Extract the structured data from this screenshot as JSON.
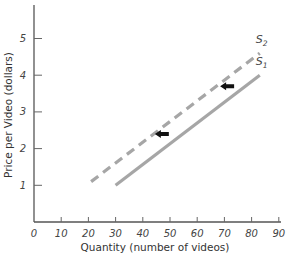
{
  "chart_data": {
    "type": "line",
    "title": "",
    "xlabel": "Quantity (number of videos)",
    "ylabel": "Price per Video (dollars)",
    "xlim": [
      0,
      90
    ],
    "ylim": [
      0,
      6
    ],
    "x_ticks": [
      "0",
      "10",
      "20",
      "30",
      "40",
      "50",
      "60",
      "70",
      "80",
      "90"
    ],
    "y_ticks": [
      "1",
      "2",
      "3",
      "4",
      "5"
    ],
    "grid": false,
    "series": [
      {
        "name": "S1",
        "label_main": "S",
        "label_sub": "1",
        "style": "solid",
        "color": "#a6a6a6",
        "points": [
          [
            30,
            1
          ],
          [
            83,
            4
          ]
        ]
      },
      {
        "name": "S2",
        "label_main": "S",
        "label_sub": "2",
        "style": "dashed",
        "color": "#a6a6a6",
        "points": [
          [
            21,
            1.1
          ],
          [
            83,
            4.6
          ]
        ]
      }
    ],
    "annotations": [
      {
        "type": "arrow-left",
        "at": [
          47,
          2.4
        ],
        "meaning": "supply shift left"
      },
      {
        "type": "arrow-left",
        "at": [
          71,
          3.7
        ],
        "meaning": "supply shift left"
      }
    ]
  }
}
